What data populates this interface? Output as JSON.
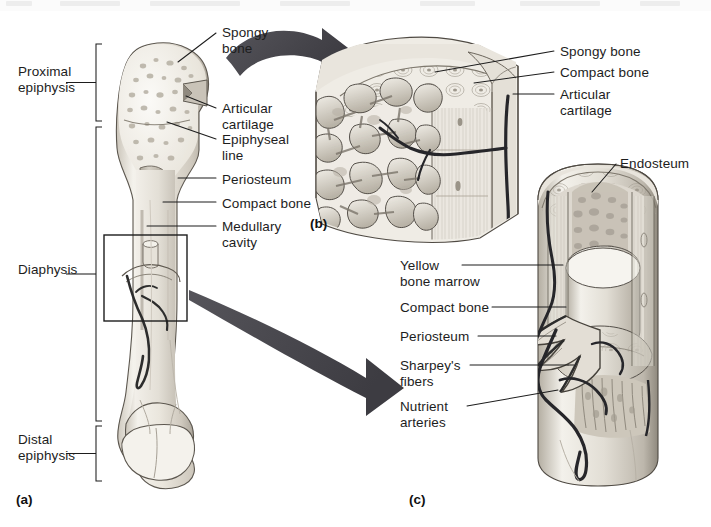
{
  "figure": {
    "type": "anatomy-diagram",
    "background": "#ffffff",
    "ink": "#1d1d1d",
    "arrow_color": "#4a4a4a",
    "bone_light": "#f2efe9",
    "bone_mid": "#d9d4cb",
    "bone_dark": "#a9a49a",
    "vessel_color": "#2b2b2b"
  },
  "panels": [
    {
      "id": "a",
      "label": "(a)",
      "x": 16,
      "y": 492
    },
    {
      "id": "b",
      "label": "(b)",
      "x": 310,
      "y": 216
    },
    {
      "id": "c",
      "label": "(c)",
      "x": 409,
      "y": 492
    }
  ],
  "panel_a": {
    "brackets": [
      {
        "name": "proximal-epiphysis",
        "label": "Proximal\nepiphysis",
        "label_x": 18,
        "label_y": 64,
        "top": 44,
        "bottom": 121,
        "x": 96
      },
      {
        "name": "diaphysis",
        "label": "Diaphysis",
        "label_x": 18,
        "label_y": 262,
        "top": 127,
        "bottom": 421,
        "x": 96
      },
      {
        "name": "distal-epiphysis",
        "label": "Distal\nepiphysis",
        "label_x": 18,
        "label_y": 432,
        "top": 426,
        "bottom": 481,
        "x": 96
      }
    ],
    "callouts": [
      {
        "name": "spongy-bone",
        "label": "Spongy\nbone",
        "x": 222,
        "y": 25,
        "lx1": 216,
        "ly1": 33,
        "lx2": 178,
        "ly2": 62
      },
      {
        "name": "articular-cartilage",
        "label": "Articular\ncartilage",
        "x": 222,
        "y": 101,
        "lx1": 216,
        "ly1": 108,
        "lx2": 186,
        "ly2": 96
      },
      {
        "name": "epiphyseal-line",
        "label": "Epiphyseal\nline",
        "x": 222,
        "y": 132,
        "lx1": 216,
        "ly1": 139,
        "lx2": 167,
        "ly2": 122
      },
      {
        "name": "periosteum",
        "label": "Periosteum",
        "x": 222,
        "y": 172,
        "lx1": 216,
        "ly1": 178,
        "lx2": 178,
        "ly2": 178
      },
      {
        "name": "compact-bone",
        "label": "Compact bone",
        "x": 222,
        "y": 196,
        "lx1": 216,
        "ly1": 202,
        "lx2": 163,
        "ly2": 202
      },
      {
        "name": "medullary-cavity",
        "label": "Medullary\ncavity",
        "x": 222,
        "y": 219,
        "lx1": 216,
        "ly1": 226,
        "lx2": 147,
        "ly2": 226
      }
    ],
    "inset_box": {
      "x": 104,
      "y": 235,
      "w": 83,
      "h": 86
    }
  },
  "panel_b": {
    "callouts": [
      {
        "name": "spongy-bone",
        "label": "Spongy bone",
        "x": 560,
        "y": 44,
        "lx1": 554,
        "ly1": 51,
        "lx2": 435,
        "ly2": 72
      },
      {
        "name": "compact-bone",
        "label": "Compact bone",
        "x": 560,
        "y": 65,
        "lx1": 554,
        "ly1": 72,
        "lx2": 474,
        "ly2": 83
      },
      {
        "name": "articular-cartilage",
        "label": "Articular\ncartilage",
        "x": 560,
        "y": 87,
        "lx1": 554,
        "ly1": 94,
        "lx2": 513,
        "ly2": 94
      }
    ]
  },
  "panel_c": {
    "callouts": [
      {
        "name": "endosteum",
        "label": "Endosteum",
        "x": 620,
        "y": 156,
        "lx1": 616,
        "ly1": 164,
        "lx2": 592,
        "ly2": 192
      },
      {
        "name": "yellow-bone-marrow",
        "label": "Yellow\nbone marrow",
        "x": 400,
        "y": 258,
        "lx1": 462,
        "ly1": 265,
        "lx2": 563,
        "ly2": 265
      },
      {
        "name": "compact-bone",
        "label": "Compact bone",
        "x": 400,
        "y": 300,
        "lx1": 492,
        "ly1": 307,
        "lx2": 566,
        "ly2": 307
      },
      {
        "name": "periosteum",
        "label": "Periosteum",
        "x": 400,
        "y": 329,
        "lx1": 478,
        "ly1": 336,
        "lx2": 556,
        "ly2": 336
      },
      {
        "name": "sharpeys-fibers",
        "label": "Sharpey's\nfibers",
        "x": 400,
        "y": 358,
        "lx1": 470,
        "ly1": 365,
        "lx2": 574,
        "ly2": 365
      },
      {
        "name": "nutrient-arteries",
        "label": "Nutrient\narteries",
        "x": 400,
        "y": 399,
        "lx1": 467,
        "ly1": 406,
        "lx2": 558,
        "ly2": 390
      }
    ]
  },
  "arrows": [
    {
      "name": "arrow-a-to-b",
      "from": "epiphysis",
      "to": "panel-b"
    },
    {
      "name": "arrow-a-to-c",
      "from": "diaphysis-inset",
      "to": "panel-c"
    }
  ]
}
